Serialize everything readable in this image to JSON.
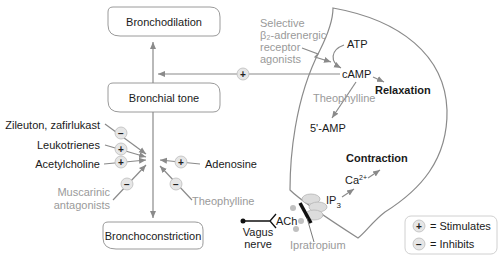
{
  "boxes": {
    "bronchodilation": "Bronchodilation",
    "bronchial_tone": "Bronchial tone",
    "bronchoconstriction": "Bronchoconstriction"
  },
  "left_inputs": [
    {
      "label": "Zileuton, zafirlukast",
      "effect": "−",
      "color": "black"
    },
    {
      "label": "Leukotrienes",
      "effect": "+",
      "color": "black"
    },
    {
      "label": "Acetylcholine",
      "effect": "+",
      "color": "black"
    },
    {
      "label_line1": "Muscarinic",
      "label_line2": "antagonists",
      "effect": "−",
      "color": "gray"
    }
  ],
  "right_inputs": [
    {
      "label": "Adenosine",
      "effect": "+",
      "color": "black"
    },
    {
      "label": "Theophylline",
      "effect": "−",
      "color": "gray"
    }
  ],
  "cell": {
    "agonist_line1": "Selective",
    "agonist_line2": "β₂-adrenergic",
    "agonist_line3": "receptor",
    "agonist_line4": "agonists",
    "atp": "ATP",
    "camp": "cAMP",
    "relaxation": "Relaxation",
    "theophylline": "Theophylline",
    "amp": "5'-AMP",
    "contraction": "Contraction",
    "ca": "Ca",
    "ca_sup": "2+",
    "ip3": "IP",
    "ip3_sub": "3",
    "ach": "ACh",
    "vagus_line1": "Vagus",
    "vagus_line2": "nerve",
    "ipratropium": "Ipratropium",
    "camp_effect": "+"
  },
  "legend": {
    "stimulates_symbol": "+",
    "stimulates_label": "= Stimulates",
    "inhibits_symbol": "−",
    "inhibits_label": "= Inhibits"
  }
}
